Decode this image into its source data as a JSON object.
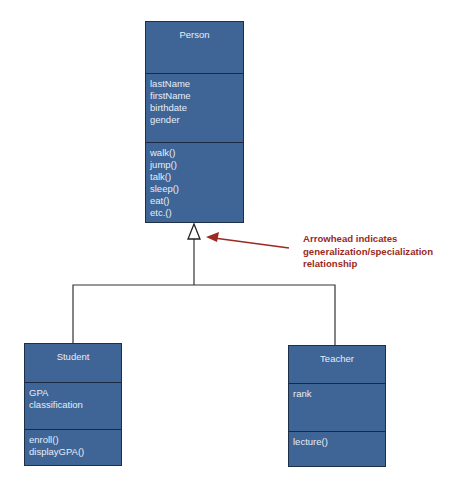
{
  "diagram": {
    "type": "UML class diagram",
    "classes": [
      {
        "name": "Person",
        "attributes": [
          "lastName",
          "firstName",
          "birthdate",
          "gender"
        ],
        "methods": [
          "walk()",
          "jump()",
          "talk()",
          "sleep()",
          "eat()",
          "etc.()"
        ]
      },
      {
        "name": "Student",
        "attributes": [
          "GPA",
          "classification"
        ],
        "methods": [
          "enroll()",
          "displayGPA()"
        ]
      },
      {
        "name": "Teacher",
        "attributes": [
          "rank"
        ],
        "methods": [
          "lecture()"
        ]
      }
    ],
    "relationships": [
      {
        "type": "generalization",
        "from": "Student",
        "to": "Person"
      },
      {
        "type": "generalization",
        "from": "Teacher",
        "to": "Person"
      }
    ],
    "annotation": {
      "lines": [
        "Arrowhead indicates",
        "generalization/specialization",
        "relationship"
      ],
      "color": "#9b2a22"
    },
    "colors": {
      "class_fill": "#3f6597",
      "class_border": "#1f2f48",
      "class_text": "#e6edf6",
      "connector": "#333333"
    }
  }
}
